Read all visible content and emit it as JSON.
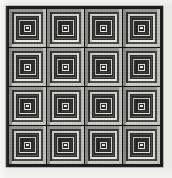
{
  "image": {
    "title": "Log Cabin Quilt",
    "description": "Grayscale photograph of a pieced log cabin quilt arranged as a four by four grid of concentric square blocks",
    "width": 172,
    "height": 178,
    "background_color": "#e9e9e6"
  },
  "quilt": {
    "label": "log-cabin-quilt",
    "left": 6,
    "top": 6,
    "width": 157,
    "height": 161,
    "border_color": "#1c1c1c",
    "border_width": 2,
    "seam_color": "#121212",
    "seam_width": 1,
    "rows": 4,
    "columns": 4,
    "block_count": 16
  },
  "block": {
    "label": "log-cabin-block",
    "ring_count": 7,
    "center_color": "#f2f1ec",
    "center_size_ratio": 0.13,
    "rings": [
      {
        "index": 0,
        "top": "#9a9a96",
        "left": "#8e8e8a",
        "bottom": "#cfcfc9",
        "right": "#c4c4be",
        "thickness": 0.07
      },
      {
        "index": 1,
        "top": "#3a3a38",
        "left": "#313130",
        "bottom": "#4f4f4c",
        "right": "#454543",
        "thickness": 0.07
      },
      {
        "index": 2,
        "top": "#d5d5cf",
        "left": "#c9c9c3",
        "bottom": "#eceae4",
        "right": "#e2e0da",
        "thickness": 0.07
      },
      {
        "index": 3,
        "top": "#4a4a47",
        "left": "#3e3e3c",
        "bottom": "#63635f",
        "right": "#575754",
        "thickness": 0.068
      },
      {
        "index": 4,
        "top": "#c6c6c0",
        "left": "#babab4",
        "bottom": "#e4e2dc",
        "right": "#d8d6d0",
        "thickness": 0.066
      },
      {
        "index": 5,
        "top": "#2c2c2a",
        "left": "#242423",
        "bottom": "#434340",
        "right": "#393936",
        "thickness": 0.064
      },
      {
        "index": 6,
        "top": "#dadad4",
        "left": "#cecec8",
        "bottom": "#efede7",
        "right": "#e6e4de",
        "thickness": 0.062
      }
    ]
  },
  "palette": {
    "darkest": "#121212",
    "dark": "#2c2c2a",
    "mid_dark": "#4a4a47",
    "mid": "#9a9a96",
    "light": "#cfcfc9",
    "lightest": "#f2f1ec"
  }
}
